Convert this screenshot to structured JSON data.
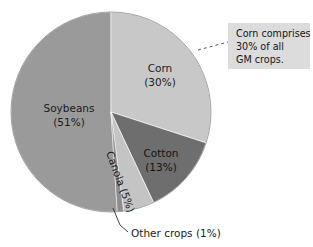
{
  "figure": {
    "background_color": "#ffffff",
    "width": 313,
    "height": 247
  },
  "chart_data": {
    "type": "pie",
    "title": "",
    "subtitle": "",
    "xlabel": "",
    "ylabel": "",
    "grid": false,
    "legend_position": "none",
    "label_format": "name (percent%)",
    "start_angle_deg": 0,
    "direction": "clockwise",
    "categories": [
      "Corn",
      "Cotton",
      "Canola",
      "Other crops",
      "Soybeans"
    ],
    "values": [
      30,
      13,
      5,
      1,
      51
    ],
    "units": "percent",
    "total": 100,
    "slices": [
      {
        "name": "Corn",
        "value": 30,
        "label_line_1": "Corn",
        "label_line_2": "(30%)",
        "color": "#c8c8c8",
        "label_placement": "inside"
      },
      {
        "name": "Cotton",
        "value": 13,
        "label_line_1": "Cotton",
        "label_line_2": "(13%)",
        "color": "#6e6e6e",
        "label_placement": "inside"
      },
      {
        "name": "Canola",
        "value": 5,
        "label_line_1": "Canola (5%)",
        "label_line_2": "",
        "color": "#c4c4c4",
        "label_placement": "inside-rotated"
      },
      {
        "name": "Other crops",
        "value": 1,
        "label_line_1": "Other crops (1%)",
        "label_line_2": "",
        "color": "#8d8d8d",
        "label_placement": "outside-leader"
      },
      {
        "name": "Soybeans",
        "value": 51,
        "label_line_1": "Soybeans",
        "label_line_2": "(51%)",
        "color": "#9a9a9a",
        "label_placement": "inside"
      }
    ],
    "annotations": [
      {
        "name": "corn-callout",
        "target_slice": "Corn",
        "text_line_1": "Corn comprises",
        "text_line_2": "30% of all",
        "text_line_3": "GM crops.",
        "box_color": "#dcdcdc",
        "leader_style": "dashed"
      }
    ]
  }
}
